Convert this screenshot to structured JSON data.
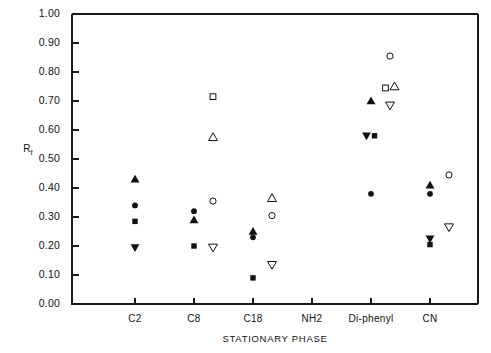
{
  "chart_data": {
    "type": "scatter",
    "title": "",
    "xlabel": "STATIONARY PHASE",
    "ylabel": "Rf",
    "ylabel_base": "R",
    "ylabel_sub": "f",
    "categories": [
      "C2",
      "C8",
      "C18",
      "NH2",
      "Di-phenyl",
      "CN"
    ],
    "ylim": [
      0.0,
      1.0
    ],
    "ytick_labels": [
      "0.00",
      "0.10",
      "0.20",
      "0.30",
      "0.40",
      "0.50",
      "0.60",
      "0.70",
      "0.80",
      "0.90",
      "1.00"
    ],
    "ytick_values": [
      0.0,
      0.1,
      0.2,
      0.3,
      0.4,
      0.5,
      0.6,
      0.7,
      0.8,
      0.9,
      1.0
    ],
    "grid": false,
    "legend": "none",
    "marker_offset_open": 0.32,
    "series": [
      {
        "name": "filled-triangle-up",
        "marker": "triangle-up",
        "fill": "filled",
        "color": "#111111",
        "points": [
          {
            "category": "C2",
            "value": 0.43
          },
          {
            "category": "C8",
            "value": 0.29
          },
          {
            "category": "C18",
            "value": 0.25
          },
          {
            "category": "Di-phenyl",
            "value": 0.7
          },
          {
            "category": "CN",
            "value": 0.41
          }
        ]
      },
      {
        "name": "filled-circle",
        "marker": "circle",
        "fill": "filled",
        "color": "#111111",
        "points": [
          {
            "category": "C2",
            "value": 0.34
          },
          {
            "category": "C8",
            "value": 0.32
          },
          {
            "category": "C18",
            "value": 0.23
          },
          {
            "category": "Di-phenyl",
            "value": 0.38
          },
          {
            "category": "CN",
            "value": 0.38
          }
        ]
      },
      {
        "name": "filled-square",
        "marker": "square",
        "fill": "filled",
        "color": "#111111",
        "points": [
          {
            "category": "C2",
            "value": 0.285
          },
          {
            "category": "C8",
            "value": 0.2
          },
          {
            "category": "C18",
            "value": 0.09
          },
          {
            "category": "Di-phenyl",
            "value": 0.58
          },
          {
            "category": "CN",
            "value": 0.205
          }
        ]
      },
      {
        "name": "filled-triangle-down",
        "marker": "triangle-down",
        "fill": "filled",
        "color": "#111111",
        "points": [
          {
            "category": "C2",
            "value": 0.195
          },
          {
            "category": "Di-phenyl",
            "value": 0.58
          },
          {
            "category": "CN",
            "value": 0.225
          }
        ]
      },
      {
        "name": "open-circle",
        "marker": "circle",
        "fill": "open",
        "color": "#111111",
        "points": [
          {
            "category": "C8",
            "value": 0.355
          },
          {
            "category": "C18",
            "value": 0.305
          },
          {
            "category": "Di-phenyl",
            "value": 0.855
          },
          {
            "category": "CN",
            "value": 0.445
          }
        ]
      },
      {
        "name": "open-square",
        "marker": "square",
        "fill": "open",
        "color": "#111111",
        "points": [
          {
            "category": "C8",
            "value": 0.715
          },
          {
            "category": "Di-phenyl",
            "value": 0.745
          }
        ]
      },
      {
        "name": "open-triangle-up",
        "marker": "triangle-up",
        "fill": "open",
        "color": "#111111",
        "points": [
          {
            "category": "C8",
            "value": 0.575
          },
          {
            "category": "C18",
            "value": 0.365
          },
          {
            "category": "Di-phenyl",
            "value": 0.75
          }
        ]
      },
      {
        "name": "open-triangle-down",
        "marker": "triangle-down",
        "fill": "open",
        "color": "#111111",
        "points": [
          {
            "category": "C8",
            "value": 0.195
          },
          {
            "category": "C18",
            "value": 0.135
          },
          {
            "category": "Di-phenyl",
            "value": 0.685
          },
          {
            "category": "CN",
            "value": 0.265
          }
        ]
      }
    ]
  },
  "plot_geometry": {
    "left": 72,
    "right": 478,
    "top": 14,
    "bottom": 304,
    "tick_x": [
      135,
      194,
      253,
      312,
      371,
      430
    ],
    "open_offset_px": 19
  }
}
